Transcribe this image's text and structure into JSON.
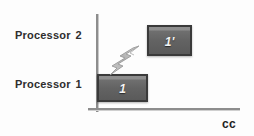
{
  "diagram": {
    "background_color": "#fdfdfd",
    "axis": {
      "vertical_color": "#8d8d8d",
      "horizontal_color": "#8d8d8d",
      "x_caption": "cc"
    },
    "rows": [
      {
        "label": "Processor",
        "index": "2",
        "name": "processor-2"
      },
      {
        "label": "Processor",
        "index": "1",
        "name": "processor-1"
      }
    ],
    "boxes": [
      {
        "name": "task-1-prime",
        "text": "1'",
        "row": "Processor 2",
        "fill_color": "#636363",
        "border_color": "#3a3a3a",
        "text_color": "#f4f4f4"
      },
      {
        "name": "task-1",
        "text": "1",
        "row": "Processor 1",
        "fill_color": "#636363",
        "border_color": "#3a3a3a",
        "text_color": "#f4f4f4"
      }
    ],
    "arrow": {
      "name": "migration-lightning-arrow",
      "shape": "lightning-bolt",
      "direction": "up-right",
      "color": "#b9b9b9"
    }
  }
}
